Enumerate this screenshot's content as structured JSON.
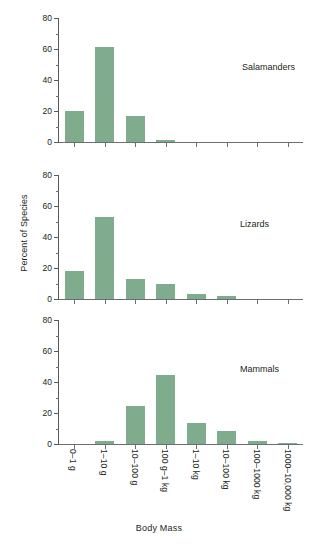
{
  "chart_data": {
    "type": "bar",
    "title": "",
    "xlabel": "Body Mass",
    "ylabel": "Percent of Species",
    "ylim": [
      0,
      80
    ],
    "yticks": [
      0,
      20,
      40,
      60,
      80
    ],
    "yminorticks": [
      10,
      30,
      50,
      70
    ],
    "grid": false,
    "legend": "none",
    "layout": "3 stacked panels sharing a common x axis",
    "categories": [
      "0–1 g",
      "1–10 g",
      "10–100 g",
      "100 g–1 kg",
      "1–10 kg",
      "10–100 kg",
      "100–1000 kg",
      "1000–10,000 kg"
    ],
    "series": [
      {
        "name": "Salamanders",
        "values": [
          20,
          61,
          17,
          1.5,
          0,
          0,
          0,
          0
        ]
      },
      {
        "name": "Lizards",
        "values": [
          18,
          53,
          13,
          10,
          3.5,
          2,
          0,
          0
        ]
      },
      {
        "name": "Mammals",
        "values": [
          0,
          2,
          24.5,
          44.5,
          13.5,
          8.5,
          2,
          0.5
        ]
      }
    ],
    "bar_color": "#7fac8c",
    "axis_color": "#58595b",
    "text_color": "#231f20"
  },
  "panels": [
    {
      "label": "Salamanders"
    },
    {
      "label": "Lizards"
    },
    {
      "label": "Mammals"
    }
  ],
  "axes": {
    "y_title": "Percent of Species",
    "x_title": "Body Mass"
  }
}
